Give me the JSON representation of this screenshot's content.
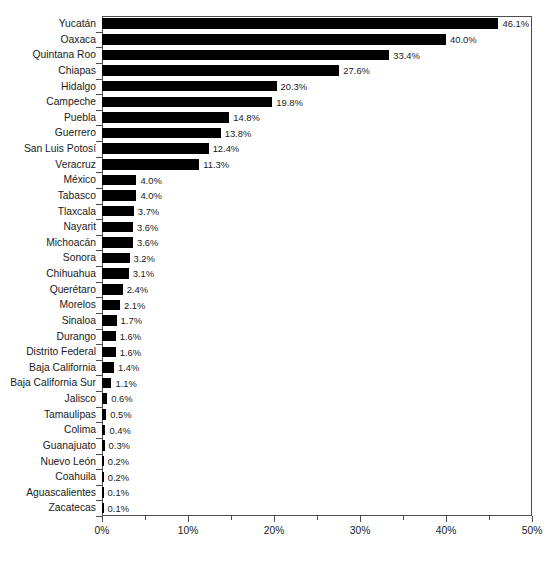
{
  "chart_data": {
    "type": "bar",
    "orientation": "horizontal",
    "title": "",
    "subtitle": "",
    "xlabel": "",
    "ylabel": "",
    "xlim": [
      0,
      50
    ],
    "xtick_labels": [
      "0%",
      "10%",
      "20%",
      "30%",
      "40%",
      "50%"
    ],
    "xtick_values": [
      0,
      10,
      20,
      30,
      40,
      50
    ],
    "xminor_values": [
      5,
      15,
      25,
      35,
      45
    ],
    "grid": false,
    "legend": null,
    "value_suffix": "%",
    "bar_color": "#000000",
    "axis_color": "#4d4d4d",
    "text_color": "#1a1a1a",
    "background_color": "#ffffff",
    "categories": [
      "Yucatán",
      "Oaxaca",
      "Quintana Roo",
      "Chiapas",
      "Hidalgo",
      "Campeche",
      "Puebla",
      "Guerrero",
      "San Luis Potosí",
      "Veracruz",
      "México",
      "Tabasco",
      "Tlaxcala",
      "Nayarit",
      "Michoacán",
      "Sonora",
      "Chihuahua",
      "Querétaro",
      "Morelos",
      "Sinaloa",
      "Durango",
      "Distrito Federal",
      "Baja California",
      "Baja California Sur",
      "Jalisco",
      "Tamaulipas",
      "Colima",
      "Guanajuato",
      "Nuevo León",
      "Coahuila",
      "Aguascalientes",
      "Zacatecas"
    ],
    "values": [
      46.1,
      40.0,
      33.4,
      27.6,
      20.3,
      19.8,
      14.8,
      13.8,
      12.4,
      11.3,
      4.0,
      4.0,
      3.7,
      3.6,
      3.6,
      3.2,
      3.1,
      2.4,
      2.1,
      1.7,
      1.6,
      1.6,
      1.4,
      1.1,
      0.6,
      0.5,
      0.4,
      0.3,
      0.2,
      0.2,
      0.1,
      0.1
    ],
    "value_labels": [
      "46.1%",
      "40.0%",
      "33.4%",
      "27.6%",
      "20.3%",
      "19.8%",
      "14.8%",
      "13.8%",
      "12.4%",
      "11.3%",
      "4.0%",
      "4.0%",
      "3.7%",
      "3.6%",
      "3.6%",
      "3.2%",
      "3.1%",
      "2.4%",
      "2.1%",
      "1.7%",
      "1.6%",
      "1.6%",
      "1.4%",
      "1.1%",
      "0.6%",
      "0.5%",
      "0.4%",
      "0.3%",
      "0.2%",
      "0.2%",
      "0.1%",
      "0.1%"
    ]
  }
}
